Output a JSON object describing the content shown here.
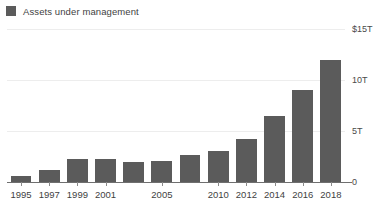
{
  "legend": {
    "items": [
      {
        "label": "Assets under management",
        "color": "#5b5b5b"
      }
    ]
  },
  "chart_data": {
    "type": "bar",
    "title": "",
    "subtitle": "",
    "xlabel": "",
    "ylabel": "",
    "categories": [
      "1995",
      "1997",
      "1999",
      "2001",
      "2003",
      "2005",
      "2007",
      "2010",
      "2012",
      "2014",
      "2016",
      "2018"
    ],
    "values": [
      0.6,
      1.2,
      2.3,
      2.3,
      2.0,
      2.1,
      2.6,
      3.0,
      4.2,
      6.5,
      9.0,
      12.0
    ],
    "series": [
      {
        "name": "Assets under management",
        "color": "#5b5b5b",
        "values": [
          0.6,
          1.2,
          2.3,
          2.3,
          2.0,
          2.1,
          2.6,
          3.0,
          4.2,
          6.5,
          9.0,
          12.0
        ]
      }
    ],
    "ylim": [
      0,
      15
    ],
    "yticks": [
      0,
      5,
      10,
      15
    ],
    "ytick_labels": [
      "0",
      "5T",
      "10T",
      "$15T"
    ],
    "xtick_labels": [
      "1995",
      "1997",
      "1999",
      "2001",
      "",
      "2005",
      "",
      "2010",
      "2012",
      "2014",
      "2016",
      "2018"
    ],
    "grid": true,
    "grid_color": "#ededed",
    "legend_position": "top-left",
    "units": "trillions of US dollars"
  }
}
